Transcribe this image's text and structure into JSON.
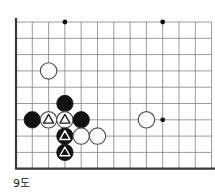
{
  "figure": {
    "caption": "9도",
    "width": 215,
    "height": 195,
    "background": "#ffffff"
  },
  "board": {
    "type": "go-board-diagram",
    "origin_x": 16,
    "origin_y": 22,
    "cell": 16.3,
    "cols": 12,
    "rows": 9,
    "line_color": "#808080",
    "edge_color": "#3a3a3a",
    "edge_width": 2.2,
    "line_width": 0.8,
    "edges": [
      "left",
      "bottom"
    ],
    "stone_radius": 8.2,
    "black_color": "#111111",
    "white_color": "#ffffff",
    "white_outline": "#4a4a4a",
    "star_color": "#111111",
    "star_radius": 2.4,
    "star_points": [
      {
        "col": 3,
        "row": 0
      },
      {
        "col": 9,
        "row": 0
      },
      {
        "col": 9,
        "row": 6
      }
    ],
    "stones": [
      {
        "col": 2,
        "row": 3,
        "color": "white",
        "mark": "none",
        "name": "white-stone-c2r3"
      },
      {
        "col": 3,
        "row": 5,
        "color": "black",
        "mark": "none",
        "name": "black-stone-c3r5"
      },
      {
        "col": 1,
        "row": 6,
        "color": "black",
        "mark": "none",
        "name": "black-stone-c1r6"
      },
      {
        "col": 2,
        "row": 6,
        "color": "white",
        "mark": "triangle",
        "name": "white-stone-triangle-c2r6"
      },
      {
        "col": 3,
        "row": 6,
        "color": "white",
        "mark": "triangle",
        "name": "white-stone-triangle-c3r6"
      },
      {
        "col": 4,
        "row": 6,
        "color": "black",
        "mark": "none",
        "name": "black-stone-c4r6"
      },
      {
        "col": 8,
        "row": 6,
        "color": "white",
        "mark": "none",
        "name": "white-stone-c8r6"
      },
      {
        "col": 3,
        "row": 7,
        "color": "black",
        "mark": "triangle",
        "name": "black-stone-triangle-c3r7"
      },
      {
        "col": 4,
        "row": 7,
        "color": "white",
        "mark": "none",
        "name": "white-stone-c4r7"
      },
      {
        "col": 5,
        "row": 7,
        "color": "white",
        "mark": "none",
        "name": "white-stone-c5r7"
      },
      {
        "col": 3,
        "row": 8,
        "color": "black",
        "mark": "triangle",
        "name": "black-stone-triangle-c3r8"
      }
    ]
  }
}
